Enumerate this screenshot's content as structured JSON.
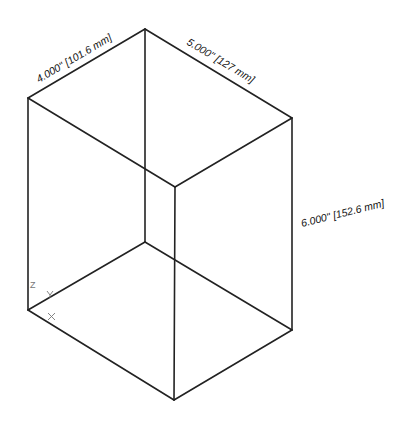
{
  "diagram": {
    "type": "isometric-box",
    "dimensions": {
      "width_label": "4.000\" [101.6 mm]",
      "depth_label": "5.000\" [127 mm]",
      "height_label": "6.000\" [152.6 mm]"
    },
    "axes": {
      "x": "X",
      "y": "Y",
      "z": "Z"
    },
    "colors": {
      "line": "#222222",
      "axis": "#777777",
      "background": "#ffffff"
    }
  }
}
